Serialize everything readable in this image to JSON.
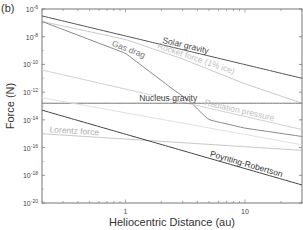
{
  "chart_data": {
    "type": "line",
    "panel_label": "(b)",
    "title": "",
    "xlabel": "Heliocentric Distance (au)",
    "ylabel": "Force (N)",
    "xscale": "log",
    "yscale": "log",
    "xlim": [
      0.2,
      30
    ],
    "ylim": [
      1e-20,
      1e-06
    ],
    "x_ticks": [
      {
        "value": 1,
        "label": "1"
      },
      {
        "value": 10,
        "label": "10"
      }
    ],
    "y_ticks": [
      {
        "value": -6,
        "base": "10",
        "exp": "-6"
      },
      {
        "value": -8,
        "base": "10",
        "exp": "-8"
      },
      {
        "value": -10,
        "base": "10",
        "exp": "-10"
      },
      {
        "value": -12,
        "base": "10",
        "exp": "-12"
      },
      {
        "value": -14,
        "base": "10",
        "exp": "-14"
      },
      {
        "value": -16,
        "base": "10",
        "exp": "-16"
      },
      {
        "value": -18,
        "base": "10",
        "exp": "-18"
      },
      {
        "value": -20,
        "base": "10",
        "exp": "-20"
      }
    ],
    "grid": false,
    "legend": "none (inline labels)",
    "series": [
      {
        "name": "Solar gravity",
        "color": "#555555",
        "x": [
          0.2,
          30
        ],
        "log10_y": [
          -6.5,
          -11.0
        ]
      },
      {
        "name": "Rocket force (1% ice)",
        "color": "#c8c8c8",
        "x": [
          0.2,
          1,
          3,
          10,
          30
        ],
        "log10_y": [
          -6.9,
          -8.2,
          -9.6,
          -11.4,
          -12.8
        ]
      },
      {
        "name": "Gas drag",
        "color": "#888888",
        "x": [
          0.2,
          1,
          2.5,
          3.5,
          4.2,
          5,
          10,
          30
        ],
        "log10_y": [
          -6.9,
          -9.2,
          -11.8,
          -12.7,
          -13.4,
          -14.0,
          -14.6,
          -15.2
        ]
      },
      {
        "name": "Radiation pressure",
        "color": "#d0d0d0",
        "x": [
          0.2,
          30
        ],
        "log10_y": [
          -10.4,
          -14.7
        ]
      },
      {
        "name": "Nucleus gravity",
        "color": "#777777",
        "x": [
          0.2,
          30
        ],
        "log10_y": [
          -12.8,
          -12.8
        ]
      },
      {
        "name": "Lorentz force",
        "color": "#c8c8c8",
        "x": [
          0.2,
          30
        ],
        "log10_y": [
          -15.0,
          -16.2
        ]
      },
      {
        "name": "Poynting-Robertson",
        "color": "#444444",
        "x": [
          0.2,
          30
        ],
        "log10_y": [
          -13.3,
          -18.7
        ]
      },
      {
        "name": "",
        "color": "#e0e0e0",
        "x": [
          0.2,
          30
        ],
        "log10_y": [
          -12.4,
          -15.8
        ]
      }
    ],
    "annotations": [
      {
        "text": "Solar gravity",
        "series": "Solar gravity",
        "x_at": 2.0,
        "color": "#444444"
      },
      {
        "text": "Rocket force (1% ice)",
        "series": "Rocket force (1% ice)",
        "x_at": 1.8,
        "color": "#c0c0c0"
      },
      {
        "text": "Gas drag",
        "series": "Gas drag",
        "x_at": 0.75,
        "color": "#777777"
      },
      {
        "text": "Radiation pressure",
        "series": "Radiation pressure",
        "x_at": 4.5,
        "color": "#c0c0c0"
      },
      {
        "text": "Nucleus gravity",
        "series": "Nucleus gravity",
        "x_at": 1.3,
        "color": "#444444"
      },
      {
        "text": "Lorentz force",
        "series": "Lorentz force",
        "x_at": 0.23,
        "color": "#b0b0b0"
      },
      {
        "text": "Poynting-Robertson",
        "series": "Poynting-Robertson",
        "x_at": 5.0,
        "color": "#333333"
      }
    ]
  }
}
